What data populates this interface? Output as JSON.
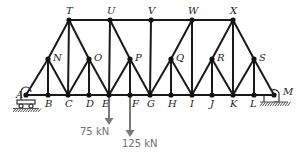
{
  "diagram": {
    "type": "truss",
    "nodes": {
      "A": {
        "x": 26,
        "y": 95,
        "label_dx": -10,
        "label_dy": 3
      },
      "B": {
        "x": 48,
        "y": 95,
        "label_dx": -3,
        "label_dy": 12
      },
      "C": {
        "x": 68,
        "y": 95,
        "label_dx": -3,
        "label_dy": 12
      },
      "D": {
        "x": 89,
        "y": 95,
        "label_dx": -3,
        "label_dy": 12
      },
      "E": {
        "x": 109,
        "y": 95,
        "label_dx": -7,
        "label_dy": 12
      },
      "F": {
        "x": 130,
        "y": 95,
        "label_dx": 2,
        "label_dy": 12
      },
      "G": {
        "x": 150,
        "y": 95,
        "label_dx": -3,
        "label_dy": 12
      },
      "H": {
        "x": 171,
        "y": 95,
        "label_dx": -3,
        "label_dy": 12
      },
      "I": {
        "x": 192,
        "y": 95,
        "label_dx": -2,
        "label_dy": 12
      },
      "J": {
        "x": 212,
        "y": 95,
        "label_dx": -2,
        "label_dy": 12
      },
      "K": {
        "x": 233,
        "y": 95,
        "label_dx": -3,
        "label_dy": 12
      },
      "L": {
        "x": 254,
        "y": 95,
        "label_dx": -4,
        "label_dy": 12
      },
      "M": {
        "x": 274,
        "y": 95,
        "label_dx": 9,
        "label_dy": 0
      },
      "N": {
        "x": 48,
        "y": 59,
        "label_dx": 5,
        "label_dy": 2
      },
      "O": {
        "x": 89,
        "y": 59,
        "label_dx": 5,
        "label_dy": 2
      },
      "P": {
        "x": 130,
        "y": 59,
        "label_dx": 5,
        "label_dy": 2
      },
      "Q": {
        "x": 171,
        "y": 59,
        "label_dx": 5,
        "label_dy": 2
      },
      "R": {
        "x": 212,
        "y": 59,
        "label_dx": 5,
        "label_dy": 2
      },
      "S": {
        "x": 254,
        "y": 59,
        "label_dx": 5,
        "label_dy": 2
      },
      "T": {
        "x": 69,
        "y": 20,
        "label_dx": -3,
        "label_dy": -6
      },
      "U": {
        "x": 110,
        "y": 20,
        "label_dx": -3,
        "label_dy": -6
      },
      "V": {
        "x": 151,
        "y": 20,
        "label_dx": -3,
        "label_dy": -6
      },
      "W": {
        "x": 192,
        "y": 20,
        "label_dx": -4,
        "label_dy": -6
      },
      "X": {
        "x": 233,
        "y": 20,
        "label_dx": -3,
        "label_dy": -6
      }
    },
    "members": [
      [
        "A",
        "B"
      ],
      [
        "B",
        "C"
      ],
      [
        "C",
        "D"
      ],
      [
        "D",
        "E"
      ],
      [
        "E",
        "F"
      ],
      [
        "F",
        "G"
      ],
      [
        "G",
        "H"
      ],
      [
        "H",
        "I"
      ],
      [
        "I",
        "J"
      ],
      [
        "J",
        "K"
      ],
      [
        "K",
        "L"
      ],
      [
        "L",
        "M"
      ],
      [
        "T",
        "U"
      ],
      [
        "U",
        "V"
      ],
      [
        "V",
        "W"
      ],
      [
        "W",
        "X"
      ],
      [
        "A",
        "N"
      ],
      [
        "N",
        "T"
      ],
      [
        "N",
        "B"
      ],
      [
        "N",
        "C"
      ],
      [
        "T",
        "C"
      ],
      [
        "T",
        "O"
      ],
      [
        "O",
        "C"
      ],
      [
        "O",
        "D"
      ],
      [
        "O",
        "E"
      ],
      [
        "U",
        "E"
      ],
      [
        "U",
        "P"
      ],
      [
        "P",
        "E"
      ],
      [
        "P",
        "F"
      ],
      [
        "P",
        "G"
      ],
      [
        "V",
        "G"
      ],
      [
        "W",
        "Q"
      ],
      [
        "Q",
        "G"
      ],
      [
        "Q",
        "H"
      ],
      [
        "Q",
        "I"
      ],
      [
        "W",
        "I"
      ],
      [
        "X",
        "R"
      ],
      [
        "R",
        "I"
      ],
      [
        "R",
        "J"
      ],
      [
        "R",
        "K"
      ],
      [
        "X",
        "K"
      ],
      [
        "X",
        "S"
      ],
      [
        "S",
        "K"
      ],
      [
        "S",
        "L"
      ],
      [
        "S",
        "M"
      ]
    ],
    "supports": [
      {
        "node": "A",
        "type": "roller"
      },
      {
        "node": "M",
        "type": "pin"
      }
    ],
    "loads": [
      {
        "node": "E",
        "label": "75 kN",
        "length": 28,
        "label_x": 80,
        "label_y": 135
      },
      {
        "node": "F",
        "label": "125 kN",
        "length": 40,
        "label_x": 122,
        "label_y": 147
      }
    ],
    "colors": {
      "member": "#1a1a1a",
      "load": "#7a7a7a",
      "label": "#222222"
    }
  }
}
